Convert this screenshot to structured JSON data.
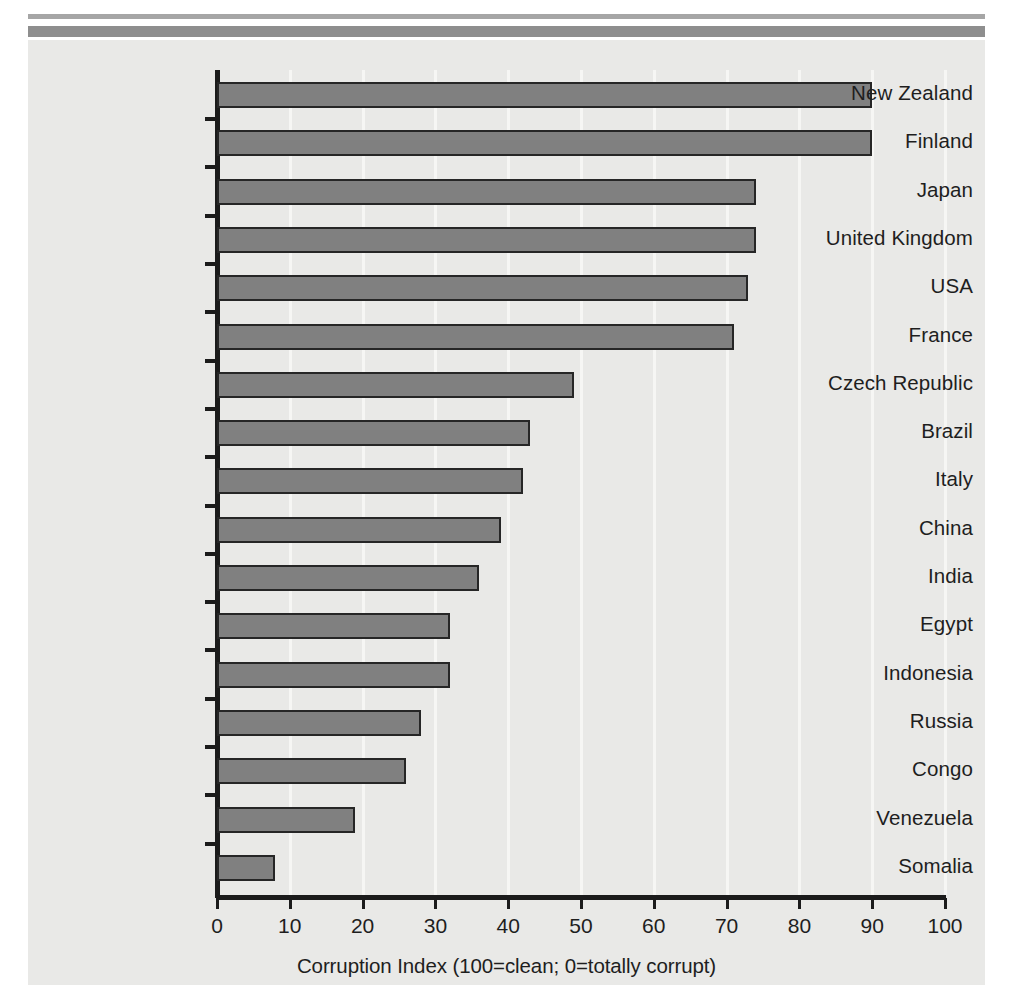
{
  "figure": {
    "background_color": "#e9e9e7",
    "page_color": "#ffffff",
    "scan_rule_color": "#9a9a9a"
  },
  "chart_data": {
    "type": "bar",
    "orientation": "horizontal",
    "title": "",
    "xlabel": "Corruption Index (100=clean; 0=totally corrupt)",
    "ylabel": "",
    "xlim": [
      0,
      100
    ],
    "xticks": [
      0,
      10,
      20,
      30,
      40,
      50,
      60,
      70,
      80,
      90,
      100
    ],
    "xtick_labels": [
      "0",
      "10",
      "20",
      "30",
      "40",
      "50",
      "60",
      "70",
      "80",
      "90",
      "100"
    ],
    "grid": "vertical-light",
    "legend": "none",
    "bar_fill_color": "#808080",
    "bar_edge_color": "#262626",
    "categories": [
      "New Zealand",
      "Finland",
      "Japan",
      "United Kingdom",
      "USA",
      "France",
      "Czech Republic",
      "Brazil",
      "Italy",
      "China",
      "India",
      "Egypt",
      "Indonesia",
      "Russia",
      "Congo",
      "Venezuela",
      "Somalia"
    ],
    "values": [
      90,
      90,
      74,
      74,
      73,
      71,
      49,
      43,
      42,
      39,
      36,
      32,
      32,
      28,
      26,
      19,
      8
    ],
    "series": [
      {
        "name": "Corruption Index",
        "values": [
          90,
          90,
          74,
          74,
          73,
          71,
          49,
          43,
          42,
          39,
          36,
          32,
          32,
          28,
          26,
          19,
          8
        ]
      }
    ]
  }
}
